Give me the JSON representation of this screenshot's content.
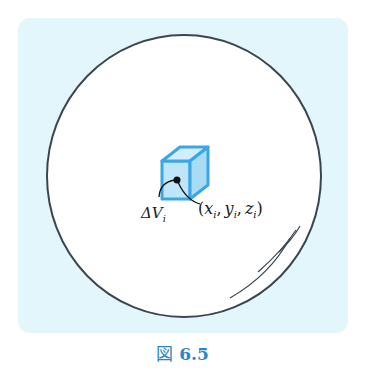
{
  "figure": {
    "caption_prefix": "図",
    "caption_number": "6.5",
    "colors": {
      "panel_bg": "#e3f6fb",
      "circle_fill": "#ffffff",
      "circle_stroke": "#3a4550",
      "cube_fill": "#bfe6f8",
      "cube_stroke": "#3aa6e6",
      "caption": "#2a86c8"
    },
    "labels": {
      "volume_element": "ΔV",
      "volume_element_sub": "i",
      "point": "(x_i, y_i, z_i)"
    },
    "point_label_parts": {
      "open": "(",
      "x": "x",
      "y": "y",
      "z": "z",
      "sub": "i",
      "comma": ",",
      "close": ")"
    }
  }
}
